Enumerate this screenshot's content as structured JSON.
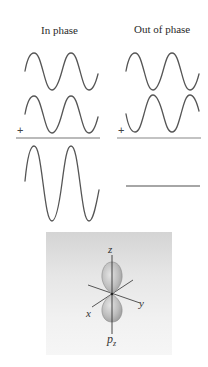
{
  "diagram": {
    "titles": {
      "in_phase": "In phase",
      "out_of_phase": "Out of phase"
    },
    "operators": {
      "plus_left": "+",
      "plus_right": "+"
    },
    "colors": {
      "wave": "#555555",
      "sum_line": "#777777",
      "orbital_lobe": "#b9b9b9",
      "box_top": "#d4d4d4",
      "box_bottom": "#f6f6f6"
    },
    "panels": [
      {
        "name": "in-phase",
        "waves": [
          "wave-1 (phase 0)",
          "wave-2 (phase 0)"
        ],
        "result": "constructive interference: doubled amplitude"
      },
      {
        "name": "out-of-phase",
        "waves": [
          "wave-1 (phase 0)",
          "wave-2 (phase 180°)"
        ],
        "result": "destructive interference: flat line"
      }
    ],
    "orbital": {
      "axes": {
        "z": "z",
        "x": "x",
        "y": "y"
      },
      "label_main": "p",
      "label_sub": "z"
    }
  }
}
